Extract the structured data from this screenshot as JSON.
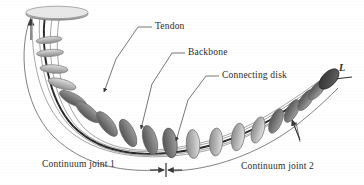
{
  "figure": {
    "type": "technical-illustration",
    "background_color": "#ffffff",
    "ink_color": "#3a3a3a"
  },
  "callouts": [
    {
      "id": "tendon",
      "label": "Tendon",
      "text_x": 155,
      "text_y": 21,
      "leader": "M152,27 L131,27 L108,52 L108,88"
    },
    {
      "id": "backbone",
      "label": "Backbone",
      "text_x": 188,
      "text_y": 47,
      "leader": "M185,53 L167,53 L148,76 L148,126"
    },
    {
      "id": "connecting_disk",
      "label": "Connecting disk",
      "text_x": 222,
      "text_y": 70,
      "leader": "M219,76 L201,76 L182,96 L182,140"
    }
  ],
  "dimensions": [
    {
      "id": "joint1",
      "label": "Continuum joint 1",
      "text_x": 42,
      "text_y": 159
    },
    {
      "id": "joint2",
      "label": "Continuum joint 2",
      "text_x": 241,
      "text_y": 161
    },
    {
      "id": "length",
      "label": "L",
      "text_x": 339,
      "text_y": 69
    }
  ],
  "structure": {
    "disk_count_joint1": 8,
    "disk_count_joint2": 9,
    "base_disk": "large flat ellipse at proximal end, top-left",
    "end_disk": "dark filled ellipse at distal tip, right",
    "tendons_visible": 4,
    "backbone": "central dark rod through all disks"
  },
  "colors": {
    "disk_light": "#c9c9c9",
    "disk_mid": "#a8a8a8",
    "disk_dark": "#6f6f6f",
    "end_disk": "#4a4a4a",
    "tendon": "#8e8e8e",
    "backbone": "#2e2e2e",
    "leader": "#4a4a4a",
    "text": "#2b2b2b"
  }
}
